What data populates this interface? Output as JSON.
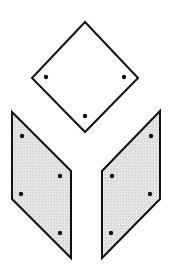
{
  "diagram": {
    "stroke_color": "#111111",
    "fill_top": "#ffffff",
    "fill_sides": "#e4e4e4",
    "faces": [
      {
        "name": "top-face",
        "points": "85,22 138,78 85,132 32,78",
        "dots": [
          [
            46,
            77
          ],
          [
            124,
            77
          ],
          [
            85,
            116
          ]
        ]
      },
      {
        "name": "left-face",
        "points": "12,112 71,171 71,258 12,199",
        "dots": [
          [
            22,
            136
          ],
          [
            60,
            176
          ],
          [
            21,
            194
          ],
          [
            60,
            233
          ]
        ]
      },
      {
        "name": "right-face",
        "points": "160,111 160,199 102,258 102,171",
        "dots": [
          [
            151,
            136
          ],
          [
            112,
            176
          ],
          [
            150,
            194
          ],
          [
            111,
            233
          ]
        ]
      }
    ]
  }
}
